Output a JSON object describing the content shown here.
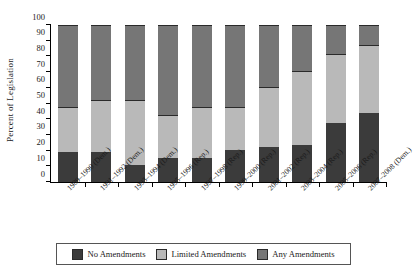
{
  "chart_data": {
    "type": "bar",
    "subtype": "stacked-bar-100",
    "title": "",
    "xlabel": "",
    "ylabel": "Percent of Legislation",
    "ylim": [
      0,
      100
    ],
    "yticks": [
      0,
      10,
      20,
      30,
      40,
      50,
      60,
      70,
      80,
      90,
      100
    ],
    "grid": false,
    "legend_position": "bottom",
    "categories": [
      "1989–1990 (Dem.)",
      "1991–1992 (Dem.)",
      "1993–1994 (Dem.)",
      "1995–1996 (Rep.)",
      "1997–1998 (Rep.)",
      "1999–2000 (Rep.)",
      "2001–2002 (Rep.)",
      "2003–2004 (Rep.)",
      "2005–2006 (Rep.)",
      "2007–2008 (Dem.)"
    ],
    "category_lines": [
      [
        "1989–1990",
        "(Dem.)"
      ],
      [
        "1991–1992",
        "(Dem.)"
      ],
      [
        "1993–1994",
        "(Dem.)"
      ],
      [
        "1995–1996",
        "(Rep.)"
      ],
      [
        "1997–1998",
        "(Rep.)"
      ],
      [
        "1999–2000",
        "(Rep.)"
      ],
      [
        "2001–2002",
        "(Rep.)"
      ],
      [
        "2003–2004",
        "(Rep.)"
      ],
      [
        "2005–2006",
        "(Rep.)"
      ],
      [
        "2007–2008",
        "(Dem.)"
      ]
    ],
    "series": [
      {
        "name": "No Amendments",
        "color": "#3b3b3b",
        "values": [
          19,
          19,
          11,
          15,
          15,
          20.5,
          22.5,
          23.5,
          37.5,
          44
        ]
      },
      {
        "name": "Limited Amendments",
        "color": "#b9b9b9",
        "values": [
          28.5,
          33,
          41.5,
          27.5,
          33,
          27.5,
          38,
          47.5,
          44,
          43
        ]
      },
      {
        "name": "Any Amendments",
        "color": "#767676",
        "values": [
          52.5,
          48,
          47.5,
          57.5,
          52,
          52,
          39.5,
          29,
          18.5,
          13
        ]
      }
    ],
    "cumulative_tops": {
      "no_amendments": [
        19,
        19,
        11,
        15,
        15,
        20.5,
        22.5,
        23.5,
        37.5,
        44
      ],
      "limited_amendments": [
        47.5,
        52,
        52.5,
        42.5,
        48,
        48,
        60.5,
        71,
        81.5,
        87
      ],
      "any_amendments": [
        100,
        100,
        100,
        100,
        100,
        100,
        100,
        100,
        100,
        100
      ]
    }
  },
  "legend": {
    "items": [
      {
        "label": "No Amendments",
        "color": "#3b3b3b"
      },
      {
        "label": "Limited Amendments",
        "color": "#b9b9b9"
      },
      {
        "label": "Any Amendments",
        "color": "#767676"
      }
    ]
  }
}
